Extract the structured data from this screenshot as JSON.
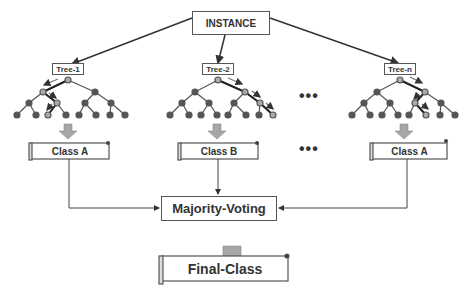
{
  "instance": {
    "label": "INSTANCE"
  },
  "trees": [
    {
      "label": "Tree-1",
      "result": "Class A"
    },
    {
      "label": "Tree-2",
      "result": "Class B"
    },
    {
      "label": "Tree-n",
      "result": "Class A"
    }
  ],
  "ellipsis": "•••",
  "aggregator": {
    "label": "Majority-Voting"
  },
  "output": {
    "label": "Final-Class"
  },
  "colors": {
    "node": "#555555",
    "highlight_node": "#aaaaaa",
    "arrow_fill": "#a6a6a6",
    "line": "#333333"
  }
}
